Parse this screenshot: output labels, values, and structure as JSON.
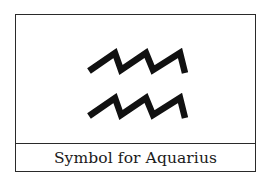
{
  "figure": {
    "caption": "Symbol for Aquarius",
    "symbol": "aquarius-symbol",
    "colors": {
      "stroke": "#111111",
      "border": "#2a2a2a",
      "background": "#ffffff"
    }
  }
}
